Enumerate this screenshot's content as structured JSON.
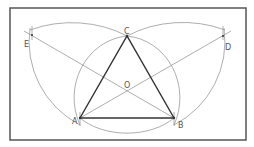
{
  "diagram": {
    "type": "geometric-construction",
    "points": {
      "A": {
        "label": "A",
        "x": 80,
        "y": 118
      },
      "B": {
        "label": "B",
        "x": 174,
        "y": 118
      },
      "C": {
        "label": "C",
        "x": 127,
        "y": 36
      },
      "D": {
        "label": "D",
        "x": 223,
        "y": 36
      },
      "E": {
        "label": "E",
        "x": 32,
        "y": 35
      },
      "O": {
        "label": "O",
        "x": 127,
        "y": 91
      }
    },
    "colors": {
      "frame": "#555555",
      "triangle": "#333333",
      "construction": "#999999",
      "label": "#555555"
    }
  }
}
